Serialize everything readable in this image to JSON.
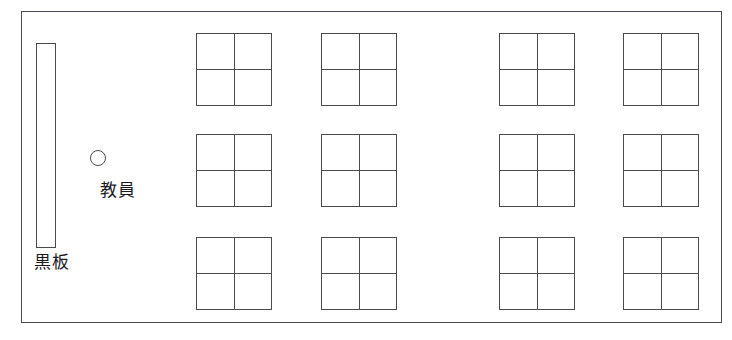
{
  "diagram": {
    "frame": {
      "name": "classroom-outline",
      "x": 21,
      "y": 11,
      "width": 701,
      "height": 312
    },
    "line_color": "#4a4a52",
    "background_color": "#ffffff",
    "text_color": "#1b1b1f",
    "blackboard": {
      "label": "黒板",
      "x": 36,
      "y": 43,
      "width": 20,
      "height": 205,
      "label_x": 34,
      "label_y": 251
    },
    "teacher": {
      "label": "教員",
      "marker_shape": "circle",
      "marker_x": 90,
      "marker_y": 150,
      "marker_size": 16,
      "label_x": 100,
      "label_y": 179
    },
    "cluster_grid": {
      "rows": 3,
      "columns": 4,
      "desks_per_cluster": 4,
      "cluster_width": 76,
      "cluster_height": 73,
      "total_desks": 48
    },
    "clusters": [
      {
        "name": "desk-cluster-r1c1",
        "row": 1,
        "column": 1,
        "x": 196,
        "y": 33
      },
      {
        "name": "desk-cluster-r1c2",
        "row": 1,
        "column": 2,
        "x": 321,
        "y": 33
      },
      {
        "name": "desk-cluster-r1c3",
        "row": 1,
        "column": 3,
        "x": 499,
        "y": 33
      },
      {
        "name": "desk-cluster-r1c4",
        "row": 1,
        "column": 4,
        "x": 623,
        "y": 33
      },
      {
        "name": "desk-cluster-r2c1",
        "row": 2,
        "column": 1,
        "x": 196,
        "y": 134
      },
      {
        "name": "desk-cluster-r2c2",
        "row": 2,
        "column": 2,
        "x": 321,
        "y": 134
      },
      {
        "name": "desk-cluster-r2c3",
        "row": 2,
        "column": 3,
        "x": 499,
        "y": 134
      },
      {
        "name": "desk-cluster-r2c4",
        "row": 2,
        "column": 4,
        "x": 623,
        "y": 134
      },
      {
        "name": "desk-cluster-r3c1",
        "row": 3,
        "column": 1,
        "x": 196,
        "y": 237
      },
      {
        "name": "desk-cluster-r3c2",
        "row": 3,
        "column": 2,
        "x": 321,
        "y": 237
      },
      {
        "name": "desk-cluster-r3c3",
        "row": 3,
        "column": 3,
        "x": 499,
        "y": 237
      },
      {
        "name": "desk-cluster-r3c4",
        "row": 3,
        "column": 4,
        "x": 623,
        "y": 237
      }
    ]
  }
}
